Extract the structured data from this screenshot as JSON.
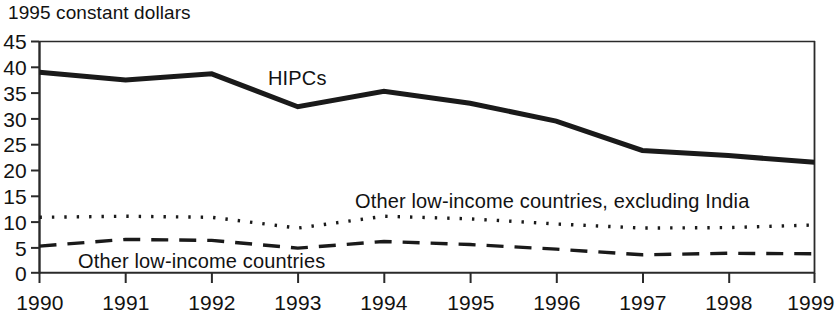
{
  "chart_data": {
    "type": "line",
    "title": "1995 constant dollars",
    "xlabel": "",
    "ylabel": "",
    "x": [
      1990,
      1991,
      1992,
      1993,
      1994,
      1995,
      1996,
      1997,
      1998,
      1999
    ],
    "categories": [
      "1990",
      "1991",
      "1992",
      "1993",
      "1994",
      "1995",
      "1996",
      "1997",
      "1998",
      "1999"
    ],
    "xlim": [
      1990,
      1999
    ],
    "ylim": [
      0,
      45
    ],
    "y_ticks": [
      0,
      5,
      10,
      15,
      20,
      25,
      30,
      35,
      40,
      45
    ],
    "y_tick_labels": [
      "0",
      "5",
      "10",
      "15",
      "20",
      "25",
      "30",
      "35",
      "40",
      "45"
    ],
    "grid": false,
    "legend_position": "inline-annotations",
    "series": [
      {
        "name": "HIPCs",
        "style": "solid",
        "line_width": 5,
        "color": "#1a1a1a",
        "values": [
          39.0,
          37.5,
          38.7,
          32.3,
          35.3,
          33.0,
          29.5,
          23.8,
          22.8,
          21.5
        ]
      },
      {
        "name": "Other low-income countries, excluding India",
        "style": "dotted",
        "line_width": 3,
        "color": "#1a1a1a",
        "values": [
          10.8,
          11.0,
          10.8,
          8.7,
          11.0,
          10.5,
          9.5,
          8.7,
          8.8,
          9.3
        ]
      },
      {
        "name": "Other low-income countries",
        "style": "dashed",
        "line_width": 3,
        "color": "#1a1a1a",
        "values": [
          5.2,
          6.5,
          6.3,
          4.8,
          6.1,
          5.5,
          4.6,
          3.5,
          3.8,
          3.7
        ]
      }
    ],
    "annotations": [
      {
        "text": "HIPCs",
        "x_px": 268,
        "y_px": 68
      },
      {
        "text": "Other low-income countries, excluding India",
        "x_px": 355,
        "y_px": 190
      },
      {
        "text": "Other low-income countries",
        "x_px": 78,
        "y_px": 250
      }
    ]
  },
  "axis": {
    "title": "1995 constant dollars"
  }
}
